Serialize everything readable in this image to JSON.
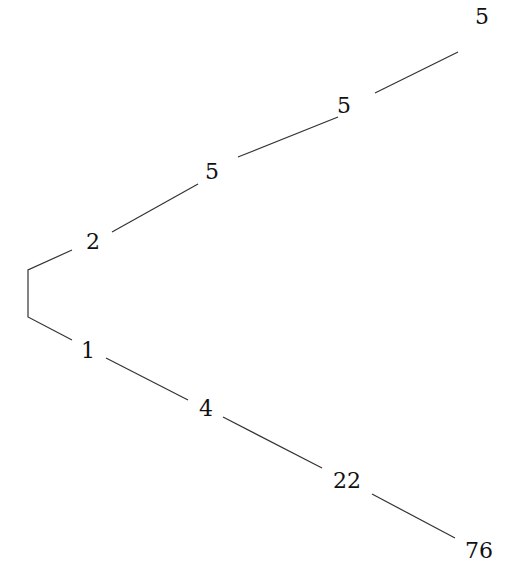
{
  "diagram": {
    "type": "tree",
    "root_bracket": true,
    "upper_branch": {
      "nodes": [
        {
          "label": "2",
          "x": 93,
          "y": 242
        },
        {
          "label": "5",
          "x": 212,
          "y": 172
        },
        {
          "label": "5",
          "x": 344,
          "y": 106
        },
        {
          "label": "5",
          "x": 482,
          "y": 17
        }
      ]
    },
    "lower_branch": {
      "nodes": [
        {
          "label": "1",
          "x": 88,
          "y": 351
        },
        {
          "label": "4",
          "x": 206,
          "y": 409
        },
        {
          "label": "22",
          "x": 347,
          "y": 481
        },
        {
          "label": "76",
          "x": 479,
          "y": 551
        }
      ]
    },
    "edges": [
      {
        "from": "bracket-top",
        "to": "2"
      },
      {
        "from": "2",
        "to": "5"
      },
      {
        "from": "5",
        "to": "5"
      },
      {
        "from": "5",
        "to": "5"
      },
      {
        "from": "bracket-bottom",
        "to": "1"
      },
      {
        "from": "1",
        "to": "4"
      },
      {
        "from": "4",
        "to": "22"
      },
      {
        "from": "22",
        "to": "76"
      }
    ],
    "colors": {
      "background": "#ffffff",
      "line": "#333333",
      "text": "#111111"
    }
  }
}
